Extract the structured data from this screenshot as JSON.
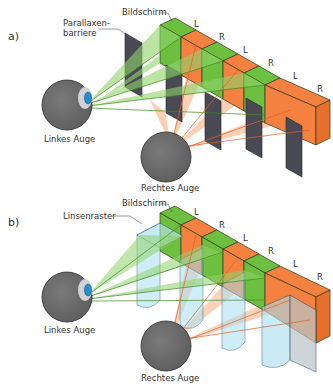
{
  "panels": [
    {
      "id": "a",
      "label": "a)",
      "screen_label": "Bildschirm",
      "element_label_line1": "Parallaxen-",
      "element_label_line2": "barriere",
      "left_eye_label": "Linkes Auge",
      "right_eye_label": "Rechtes Auge",
      "pixel_labels": [
        "L",
        "R",
        "L",
        "R",
        "L",
        "R"
      ]
    },
    {
      "id": "b",
      "label": "b)",
      "screen_label": "Bildschirm",
      "element_label_line1": "Linsenraster",
      "left_eye_label": "Linkes Auge",
      "right_eye_label": "Rechtes Auge",
      "pixel_labels": [
        "L",
        "R",
        "L",
        "R",
        "L",
        "R"
      ]
    }
  ],
  "colors": {
    "left_pixel": "#6cbf3f",
    "right_pixel": "#f4813f",
    "eye": "#6b6b6b",
    "iris": "#1f8fd6",
    "barrier": "#4a4a55",
    "lens": "#a8dff0"
  }
}
